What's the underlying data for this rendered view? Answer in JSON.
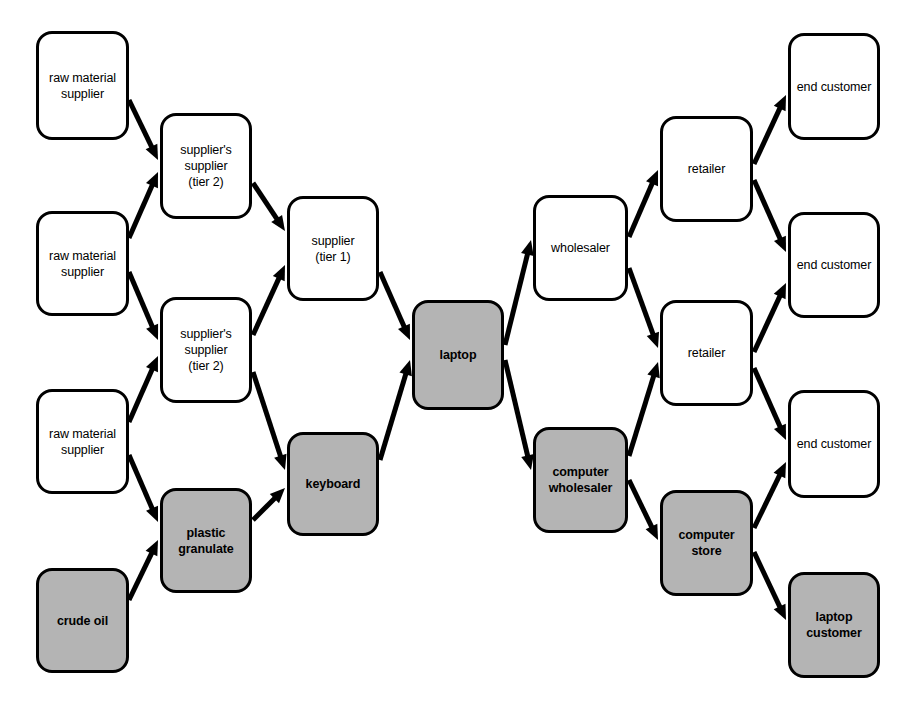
{
  "diagram": {
    "colors": {
      "node_fill_white": "#ffffff",
      "node_fill_gray": "#b4b4b4",
      "stroke": "#000000",
      "background": "#ffffff"
    },
    "nodes": [
      {
        "id": "raw1",
        "label": "raw material\nsupplier",
        "style": "white",
        "x": 36,
        "y": 31,
        "w": 93,
        "h": 109
      },
      {
        "id": "raw2",
        "label": "raw material\nsupplier",
        "style": "white",
        "x": 36,
        "y": 211,
        "w": 93,
        "h": 105
      },
      {
        "id": "raw3",
        "label": "raw material\nsupplier",
        "style": "white",
        "x": 36,
        "y": 389,
        "w": 93,
        "h": 105
      },
      {
        "id": "crude",
        "label": "crude oil",
        "style": "gray",
        "x": 36,
        "y": 568,
        "w": 93,
        "h": 105
      },
      {
        "id": "supsup1",
        "label": "supplier's\nsupplier\n(tier 2)",
        "style": "white",
        "x": 160,
        "y": 113,
        "w": 92,
        "h": 106
      },
      {
        "id": "supsup2",
        "label": "supplier's\nsupplier\n(tier 2)",
        "style": "white",
        "x": 160,
        "y": 297,
        "w": 92,
        "h": 106
      },
      {
        "id": "plastic",
        "label": "plastic\ngranulate",
        "style": "gray",
        "x": 160,
        "y": 488,
        "w": 92,
        "h": 105
      },
      {
        "id": "sup1",
        "label": "supplier\n(tier 1)",
        "style": "white",
        "x": 287,
        "y": 196,
        "w": 92,
        "h": 105
      },
      {
        "id": "keyboard",
        "label": "keyboard",
        "style": "gray",
        "x": 287,
        "y": 432,
        "w": 92,
        "h": 104
      },
      {
        "id": "laptop",
        "label": "laptop",
        "style": "gray",
        "x": 412,
        "y": 300,
        "w": 92,
        "h": 110
      },
      {
        "id": "wholesaler",
        "label": "wholesaler",
        "style": "white",
        "x": 533,
        "y": 195,
        "w": 95,
        "h": 106
      },
      {
        "id": "compwhole",
        "label": "computer\nwholesaler",
        "style": "gray",
        "x": 533,
        "y": 427,
        "w": 95,
        "h": 106
      },
      {
        "id": "retailer1",
        "label": "retailer",
        "style": "white",
        "x": 660,
        "y": 116,
        "w": 93,
        "h": 106
      },
      {
        "id": "retailer2",
        "label": "retailer",
        "style": "white",
        "x": 660,
        "y": 300,
        "w": 93,
        "h": 106
      },
      {
        "id": "compstore",
        "label": "computer\nstore",
        "style": "gray",
        "x": 660,
        "y": 490,
        "w": 93,
        "h": 106
      },
      {
        "id": "end1",
        "label": "end customer",
        "style": "white",
        "x": 788,
        "y": 33,
        "w": 92,
        "h": 107
      },
      {
        "id": "end2",
        "label": "end customer",
        "style": "white",
        "x": 788,
        "y": 212,
        "w": 92,
        "h": 106
      },
      {
        "id": "end3",
        "label": "end customer",
        "style": "white",
        "x": 788,
        "y": 390,
        "w": 92,
        "h": 108
      },
      {
        "id": "laptopcust",
        "label": "laptop\ncustomer",
        "style": "gray",
        "x": 788,
        "y": 572,
        "w": 92,
        "h": 106
      }
    ],
    "edges": [
      {
        "from": "raw1",
        "to": "supsup1",
        "x1": 129,
        "y1": 100,
        "x2": 158,
        "y2": 160
      },
      {
        "from": "raw2",
        "to": "supsup1",
        "x1": 129,
        "y1": 238,
        "x2": 158,
        "y2": 172
      },
      {
        "from": "raw2",
        "to": "supsup2",
        "x1": 129,
        "y1": 272,
        "x2": 158,
        "y2": 340
      },
      {
        "from": "raw3",
        "to": "supsup2",
        "x1": 129,
        "y1": 422,
        "x2": 158,
        "y2": 356
      },
      {
        "from": "raw3",
        "to": "plastic",
        "x1": 129,
        "y1": 455,
        "x2": 158,
        "y2": 522
      },
      {
        "from": "crude",
        "to": "plastic",
        "x1": 129,
        "y1": 600,
        "x2": 158,
        "y2": 540
      },
      {
        "from": "supsup1",
        "to": "sup1",
        "x1": 253,
        "y1": 183,
        "x2": 285,
        "y2": 231
      },
      {
        "from": "supsup2",
        "to": "sup1",
        "x1": 253,
        "y1": 335,
        "x2": 285,
        "y2": 265
      },
      {
        "from": "supsup2",
        "to": "keyboard",
        "x1": 253,
        "y1": 372,
        "x2": 285,
        "y2": 470
      },
      {
        "from": "plastic",
        "to": "keyboard",
        "x1": 253,
        "y1": 520,
        "x2": 285,
        "y2": 488
      },
      {
        "from": "sup1",
        "to": "laptop",
        "x1": 380,
        "y1": 272,
        "x2": 410,
        "y2": 340
      },
      {
        "from": "keyboard",
        "to": "laptop",
        "x1": 380,
        "y1": 460,
        "x2": 410,
        "y2": 360
      },
      {
        "from": "laptop",
        "to": "wholesaler",
        "x1": 505,
        "y1": 345,
        "x2": 531,
        "y2": 240
      },
      {
        "from": "laptop",
        "to": "compwhole",
        "x1": 505,
        "y1": 360,
        "x2": 531,
        "y2": 470
      },
      {
        "from": "wholesaler",
        "to": "retailer1",
        "x1": 629,
        "y1": 237,
        "x2": 658,
        "y2": 170
      },
      {
        "from": "wholesaler",
        "to": "retailer2",
        "x1": 629,
        "y1": 268,
        "x2": 658,
        "y2": 348
      },
      {
        "from": "compwhole",
        "to": "retailer2",
        "x1": 629,
        "y1": 456,
        "x2": 658,
        "y2": 362
      },
      {
        "from": "compwhole",
        "to": "compstore",
        "x1": 629,
        "y1": 480,
        "x2": 658,
        "y2": 540
      },
      {
        "from": "retailer1",
        "to": "end1",
        "x1": 754,
        "y1": 164,
        "x2": 786,
        "y2": 95
      },
      {
        "from": "retailer1",
        "to": "end2",
        "x1": 754,
        "y1": 180,
        "x2": 786,
        "y2": 252
      },
      {
        "from": "retailer2",
        "to": "end2",
        "x1": 754,
        "y1": 352,
        "x2": 786,
        "y2": 283
      },
      {
        "from": "retailer2",
        "to": "end3",
        "x1": 754,
        "y1": 368,
        "x2": 786,
        "y2": 440
      },
      {
        "from": "compstore",
        "to": "end3",
        "x1": 754,
        "y1": 528,
        "x2": 786,
        "y2": 462
      },
      {
        "from": "compstore",
        "to": "laptopcust",
        "x1": 754,
        "y1": 552,
        "x2": 786,
        "y2": 620
      }
    ]
  }
}
